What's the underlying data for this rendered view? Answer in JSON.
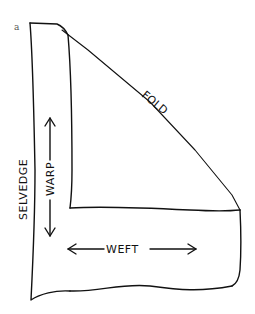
{
  "figure": {
    "panel_label": "a",
    "labels": {
      "fold": "FOLD",
      "selvedge": "SELVEDGE",
      "warp": "WARP",
      "weft": "WEFT"
    },
    "colors": {
      "ink": "#111111",
      "background": "#ffffff"
    }
  }
}
